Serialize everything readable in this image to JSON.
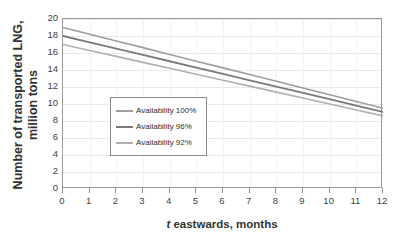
{
  "chart_data": {
    "type": "line",
    "title": "",
    "xlabel": "t eastwards, months",
    "xlabel_symbol": "t",
    "xlabel_rest": " eastwards, months",
    "ylabel_line1": "Number of transported LNG,",
    "ylabel_line2": "million tons",
    "x": [
      0,
      1,
      2,
      3,
      4,
      5,
      6,
      7,
      8,
      9,
      10,
      11,
      12
    ],
    "xlim": [
      0,
      12
    ],
    "ylim": [
      0,
      20
    ],
    "xticks": [
      "0",
      "1",
      "2",
      "3",
      "4",
      "5",
      "6",
      "7",
      "8",
      "9",
      "10",
      "11",
      "12"
    ],
    "yticks": [
      "0",
      "2",
      "4",
      "6",
      "8",
      "10",
      "12",
      "14",
      "16",
      "18",
      "20"
    ],
    "grid": true,
    "legend_position": "center-left-inside",
    "series": [
      {
        "name": "Availability 100%",
        "color": "#9d9d9d",
        "width": 1.6,
        "values": [
          19.0,
          18.21,
          17.42,
          16.63,
          15.83,
          15.04,
          14.25,
          13.46,
          12.67,
          11.88,
          11.08,
          10.29,
          9.5
        ]
      },
      {
        "name": "Availability 96%",
        "color": "#7a7a7a",
        "width": 1.8,
        "values": [
          18.0,
          17.26,
          16.51,
          15.77,
          15.03,
          14.28,
          13.54,
          12.79,
          12.05,
          11.31,
          10.56,
          9.82,
          9.08
        ]
      },
      {
        "name": "Availability 92%",
        "color": "#b0b0b0",
        "width": 1.6,
        "values": [
          17.0,
          16.3,
          15.6,
          14.9,
          14.2,
          13.5,
          12.8,
          12.1,
          11.4,
          10.7,
          10.0,
          9.3,
          8.6
        ]
      }
    ]
  },
  "legend": {
    "items": [
      {
        "label": "Availability 100%",
        "color": "#9d9d9d"
      },
      {
        "label": "Availability 96%",
        "color": "#7a7a7a"
      },
      {
        "label": "Availability 92%",
        "color": "#b0b0b0"
      }
    ]
  },
  "colors": {
    "axis": "#9a9a9a",
    "gridline": "#e9e9e9",
    "text": "#333333",
    "background": "#ffffff"
  }
}
